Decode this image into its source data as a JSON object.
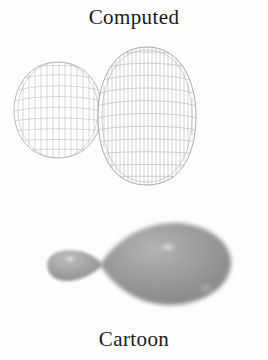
{
  "figure": {
    "kind": "orbital-comparison-illustration",
    "background_color": "#fdfdfc",
    "top_caption": "Computed",
    "bottom_caption": "Cartoon",
    "caption_color": "#1a1a18"
  },
  "panels": {
    "computed": {
      "label": "Computed",
      "style": "wireframe-mesh",
      "line_color": "#b4b4b4",
      "accent_line_color": "#8f8f8f",
      "fill_color": "#ffffff",
      "description": "Wireframe mesh surface of a hybrid atomic orbital with two lobes",
      "lobes": [
        {
          "name": "small-lobe",
          "side": "left",
          "center_x": 58,
          "center_y": 110,
          "radius_x": 44,
          "radius_y": 48
        },
        {
          "name": "large-lobe",
          "side": "right",
          "center_x": 147,
          "center_y": 116,
          "radius_x": 49,
          "radius_y": 69
        }
      ],
      "mesh": {
        "meridian_count": 22,
        "parallel_count": 9
      }
    },
    "cartoon": {
      "label": "Cartoon",
      "style": "shaded-solid",
      "body_color": "#9b9b9b",
      "shadow_color": "#7b7b7b",
      "highlight_color": "#f2f2f2",
      "description": "Smooth shaded rendering of the same two-lobed orbital",
      "lobes": [
        {
          "name": "small-lobe",
          "side": "left",
          "center_x": 76,
          "center_y": 268,
          "radius_x": 26,
          "radius_y": 15
        },
        {
          "name": "large-lobe",
          "side": "right",
          "center_x": 168,
          "center_y": 265,
          "radius_x": 64,
          "radius_y": 42
        }
      ],
      "highlights": [
        {
          "name": "large-lobe-specular",
          "x": 167,
          "y": 247,
          "width": 13,
          "height": 5
        },
        {
          "name": "small-lobe-specular",
          "x": 72,
          "y": 259,
          "width": 7,
          "height": 3
        }
      ]
    }
  }
}
